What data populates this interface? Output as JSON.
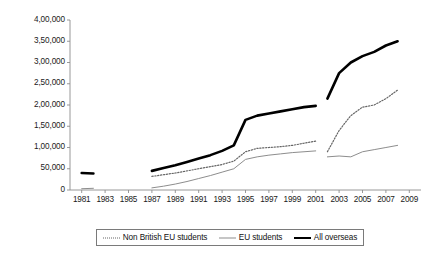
{
  "chart_data": {
    "type": "line",
    "title": "",
    "subtitle": "",
    "xlabel": "",
    "ylabel": "",
    "xlim": [
      1980,
      2010
    ],
    "ylim": [
      0,
      400000
    ],
    "ytick_step": 50000,
    "xtick_step": 2,
    "grid": false,
    "legend_position": "bottom",
    "number_format": "indian",
    "axis_color": "#8d8d8d",
    "y_ticks": [
      0,
      50000,
      100000,
      150000,
      200000,
      250000,
      300000,
      350000,
      400000
    ],
    "y_tick_labels": [
      "0",
      "50,000",
      "1,00,000",
      "1,50,000",
      "2,00,000",
      "2,50,000",
      "3,00,000",
      "3,50,000",
      "4,00,000"
    ],
    "x_ticks": [
      1981,
      1983,
      1985,
      1987,
      1989,
      1991,
      1993,
      1995,
      1997,
      1999,
      2001,
      2003,
      2005,
      2007,
      2009
    ],
    "x_tick_labels": [
      "1981",
      "1983",
      "1985",
      "1987",
      "1989",
      "1991",
      "1993",
      "1995",
      "1997",
      "1999",
      "2001",
      "2003",
      "2005",
      "2007",
      "2009"
    ],
    "series": [
      {
        "name": "Non British EU students",
        "style": "dotted",
        "color": "#666666",
        "width": 1.2,
        "segments": [
          {
            "x": [
              1987,
              1988,
              1989,
              1990,
              1991,
              1992,
              1993,
              1994,
              1995,
              1996,
              1997,
              1998,
              1999,
              2000,
              2001
            ],
            "y": [
              32000,
              36000,
              40000,
              45000,
              50000,
              55000,
              60000,
              68000,
              90000,
              98000,
              100000,
              102000,
              105000,
              110000,
              115000
            ]
          },
          {
            "x": [
              2002,
              2003,
              2004,
              2005,
              2006,
              2007,
              2008
            ],
            "y": [
              90000,
              140000,
              175000,
              195000,
              200000,
              215000,
              235000
            ]
          }
        ]
      },
      {
        "name": "EU students",
        "style": "solid-thin",
        "color": "#8d8d8d",
        "width": 1.0,
        "segments": [
          {
            "x": [
              1981,
              1982
            ],
            "y": [
              3000,
              4000
            ]
          },
          {
            "x": [
              1987,
              1988,
              1989,
              1990,
              1991,
              1992,
              1993,
              1994,
              1995,
              1996,
              1997,
              1998,
              1999,
              2000,
              2001
            ],
            "y": [
              5000,
              9000,
              14000,
              20000,
              27000,
              34000,
              42000,
              50000,
              72000,
              78000,
              82000,
              85000,
              88000,
              90000,
              92000
            ]
          },
          {
            "x": [
              2002,
              2003,
              2004,
              2005,
              2006,
              2007,
              2008
            ],
            "y": [
              78000,
              80000,
              78000,
              90000,
              95000,
              100000,
              105000
            ]
          }
        ]
      },
      {
        "name": "All overseas",
        "style": "solid-thick",
        "color": "#000000",
        "width": 2.6,
        "segments": [
          {
            "x": [
              1981,
              1982
            ],
            "y": [
              40000,
              39000
            ]
          },
          {
            "x": [
              1987,
              1988,
              1989,
              1990,
              1991,
              1992,
              1993,
              1994,
              1995,
              1996,
              1997,
              1998,
              1999,
              2000,
              2001
            ],
            "y": [
              45000,
              52000,
              58000,
              66000,
              74000,
              82000,
              92000,
              105000,
              165000,
              175000,
              180000,
              185000,
              190000,
              195000,
              198000
            ]
          },
          {
            "x": [
              2002,
              2003,
              2004,
              2005,
              2006,
              2007,
              2008
            ],
            "y": [
              215000,
              275000,
              300000,
              315000,
              325000,
              340000,
              350000
            ]
          }
        ]
      }
    ]
  },
  "legend": {
    "items": [
      {
        "label": "Non British EU students",
        "swatch": "dotted-line-swatch"
      },
      {
        "label": "EU students",
        "swatch": "thin-line-swatch"
      },
      {
        "label": "All overseas",
        "swatch": "thick-line-swatch"
      }
    ]
  }
}
